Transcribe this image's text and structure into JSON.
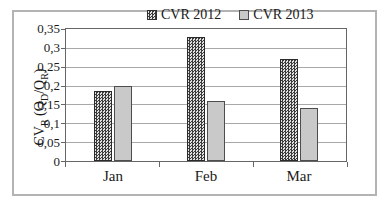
{
  "chart_data": {
    "type": "bar",
    "categories": [
      "Jan",
      "Feb",
      "Mar"
    ],
    "series": [
      {
        "name": "CVR 2012",
        "values": [
          0.185,
          0.33,
          0.27
        ],
        "fill": "checker-pattern"
      },
      {
        "name": "CVR 2013",
        "values": [
          0.2,
          0.16,
          0.14
        ],
        "fill": "solid"
      }
    ],
    "title": "",
    "xlabel": "",
    "ylabel": "CVR (QD/QR)",
    "ylabel_parts": [
      {
        "text": "CV"
      },
      {
        "text": "R"
      },
      {
        "text": " (Q"
      },
      {
        "text": "D"
      },
      {
        "text": "/Q"
      },
      {
        "text": "R"
      },
      {
        "text": ")"
      }
    ],
    "ylim": [
      0,
      0.35
    ],
    "ytick_step": 0.05,
    "ytick_labels_bottom_to_top": [
      "0",
      "0,05",
      "0,1",
      "0,15",
      "0,2",
      "0,25",
      "0,3",
      "0,35"
    ],
    "grid": "horizontal",
    "legend_position": "top-center",
    "decimal_separator": ","
  },
  "colors": {
    "frame_border": "#b3b3b3",
    "plot_border": "#666666",
    "gridline": "#a8a8a8",
    "text": "#1a1a1a",
    "bar_2013_fill": "#c9c9c9",
    "bar_pattern_dark": "#3b3b3b",
    "bar_pattern_light": "#e2e2e2"
  }
}
